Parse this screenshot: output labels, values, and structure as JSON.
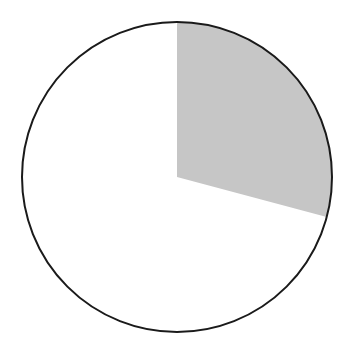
{
  "figure": {
    "name": "pie-chart-figure",
    "width": 352,
    "height": 349,
    "background_color": "#ffffff"
  },
  "chart_data": {
    "type": "pie",
    "title": "",
    "subtitle": "",
    "xlabel": "",
    "ylabel": "",
    "legend": false,
    "legend_position": "none",
    "grid": false,
    "labels_shown": false,
    "categories": [
      "Shaded sector",
      "Unshaded sector"
    ],
    "values": [
      29,
      71
    ],
    "value_unit": "percent",
    "angles_deg": [
      105,
      255
    ],
    "start_angle_deg": 0,
    "direction": "clockwise",
    "colors": [
      "#c6c6c6",
      "#ffffff"
    ],
    "annotations": [],
    "tick_labels": [],
    "slices": [
      {
        "label": "Shaded sector",
        "value": 29,
        "angle_deg": 105,
        "start_angle_deg": 0,
        "end_angle_deg": 105,
        "fill": "#c6c6c6",
        "exploded": false
      },
      {
        "label": "Unshaded sector",
        "value": 71,
        "angle_deg": 255,
        "start_angle_deg": 105,
        "end_angle_deg": 360,
        "fill": "#ffffff",
        "exploded": false
      }
    ]
  },
  "geometry": {
    "center_x": 177,
    "center_y": 177,
    "radius": 155,
    "outline_color": "#1a1a1a",
    "outline_width": 2,
    "fill_color": "#ffffff",
    "sector_fill_color": "#c6c6c6"
  }
}
